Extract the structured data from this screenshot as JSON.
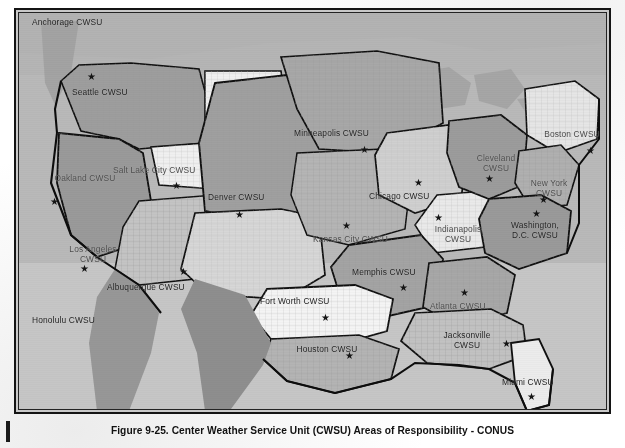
{
  "document": {
    "caption": "Figure 9-25. Center Weather Service Unit (CWSU) Areas of Responsibility - CONUS",
    "figure_number": "9-25"
  },
  "figure": {
    "type": "map",
    "title": "Center Weather Service Unit (CWSU) Areas of Responsibility - CONUS",
    "region": "CONUS",
    "background_color": "#c9c9c9",
    "frame_color": "#141414"
  },
  "map": {
    "ocean_color": "#b9b9b9",
    "land_base_color": "#c6c6c6",
    "border_color": "#101010",
    "marker_glyph": "★",
    "labels": [
      {
        "name": "anchorage",
        "text": "Anchorage CWSU",
        "x": 30,
        "y": 16,
        "marker": false,
        "lines": 1,
        "tone": "dark"
      },
      {
        "name": "seattle",
        "text": "Seattle CWSU",
        "x": 70,
        "y": 86,
        "marker": true,
        "marker_x": 85,
        "marker_y": 70,
        "lines": 1,
        "tone": "dark"
      },
      {
        "name": "oakland",
        "text": "Oakland CWSU",
        "x": 52,
        "y": 172,
        "marker": true,
        "marker_x": 48,
        "marker_y": 195,
        "lines": 2,
        "tone": "faint"
      },
      {
        "name": "salt-lake-city",
        "text": "Salt Lake City CWSU",
        "x": 111,
        "y": 164,
        "marker": true,
        "marker_x": 170,
        "marker_y": 179,
        "lines": 1,
        "tone": "faint"
      },
      {
        "name": "los-angeles",
        "text": "Los Angeles CWSU",
        "x": 60,
        "y": 243,
        "marker": true,
        "marker_x": 78,
        "marker_y": 262,
        "lines": 2,
        "tone": "faint"
      },
      {
        "name": "honolulu",
        "text": "Honolulu CWSU",
        "x": 30,
        "y": 314,
        "marker": false,
        "lines": 1,
        "tone": "dark"
      },
      {
        "name": "denver",
        "text": "Denver CWSU",
        "x": 206,
        "y": 191,
        "marker": true,
        "marker_x": 233,
        "marker_y": 208,
        "lines": 1,
        "tone": "dark"
      },
      {
        "name": "albuquerque",
        "text": "Albuquerque CWSU",
        "x": 105,
        "y": 281,
        "marker": true,
        "marker_x": 177,
        "marker_y": 265,
        "lines": 1,
        "tone": "dark"
      },
      {
        "name": "minneapolis",
        "text": "Minneapolis CWSU",
        "x": 292,
        "y": 127,
        "marker": true,
        "marker_x": 358,
        "marker_y": 143,
        "lines": 1,
        "tone": "dark"
      },
      {
        "name": "kansas-city",
        "text": "Kansas City CWSU",
        "x": 311,
        "y": 233,
        "marker": true,
        "marker_x": 340,
        "marker_y": 219,
        "lines": 1,
        "tone": "faint"
      },
      {
        "name": "fort-worth",
        "text": "Fort Worth CWSU",
        "x": 258,
        "y": 295,
        "marker": true,
        "marker_x": 319,
        "marker_y": 311,
        "lines": 1,
        "tone": "dark"
      },
      {
        "name": "houston",
        "text": "Houston CWSU",
        "x": 294,
        "y": 343,
        "marker": true,
        "marker_x": 343,
        "marker_y": 349,
        "lines": 2,
        "tone": "dark"
      },
      {
        "name": "chicago",
        "text": "Chicago CWSU",
        "x": 367,
        "y": 190,
        "marker": true,
        "marker_x": 412,
        "marker_y": 176,
        "lines": 1,
        "tone": "dark"
      },
      {
        "name": "memphis",
        "text": "Memphis CWSU",
        "x": 350,
        "y": 266,
        "marker": true,
        "marker_x": 397,
        "marker_y": 281,
        "lines": 1,
        "tone": "dark"
      },
      {
        "name": "indianapolis",
        "text": "Indianapolis CWSU",
        "x": 425,
        "y": 223,
        "marker": true,
        "marker_x": 432,
        "marker_y": 211,
        "lines": 2,
        "tone": "faint"
      },
      {
        "name": "cleveland",
        "text": "Cleveland CWSU",
        "x": 463,
        "y": 152,
        "marker": true,
        "marker_x": 483,
        "marker_y": 172,
        "lines": 2,
        "tone": "faint"
      },
      {
        "name": "boston",
        "text": "Boston CWSU",
        "x": 539,
        "y": 128,
        "marker": true,
        "marker_x": 584,
        "marker_y": 144,
        "lines": 2,
        "tone": "faint"
      },
      {
        "name": "new-york",
        "text": "New York CWSU",
        "x": 516,
        "y": 177,
        "marker": true,
        "marker_x": 537,
        "marker_y": 193,
        "lines": 2,
        "tone": "faint"
      },
      {
        "name": "washington-dc",
        "text": "Washington, D.C. CWSU",
        "x": 502,
        "y": 219,
        "marker": true,
        "marker_x": 530,
        "marker_y": 207,
        "lines": 2,
        "tone": "dark"
      },
      {
        "name": "atlanta",
        "text": "Atlanta CWSU",
        "x": 428,
        "y": 300,
        "marker": true,
        "marker_x": 458,
        "marker_y": 286,
        "lines": 1,
        "tone": "faint"
      },
      {
        "name": "jacksonville",
        "text": "Jacksonville CWSU",
        "x": 434,
        "y": 329,
        "marker": true,
        "marker_x": 500,
        "marker_y": 337,
        "lines": 2,
        "tone": "dark"
      },
      {
        "name": "miami",
        "text": "Miami CWSU",
        "x": 500,
        "y": 376,
        "marker": true,
        "marker_x": 525,
        "marker_y": 390,
        "lines": 1,
        "tone": "dark"
      }
    ]
  }
}
